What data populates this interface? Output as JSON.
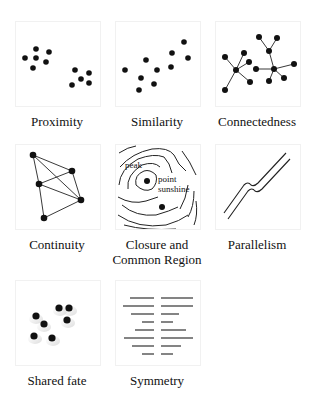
{
  "figure": {
    "panels": [
      {
        "id": "proximity",
        "caption": "Proximity"
      },
      {
        "id": "similarity",
        "caption": "Similarity"
      },
      {
        "id": "connectedness",
        "caption": "Connectedness"
      },
      {
        "id": "continuity",
        "caption": "Continuity"
      },
      {
        "id": "closure",
        "caption_line1": "Closure and",
        "caption_line2": "Common Region",
        "labels": {
          "peak": "peak",
          "point": "point",
          "sunshine": "sunshine"
        }
      },
      {
        "id": "parallelism",
        "caption": "Parallelism"
      },
      {
        "id": "shared-fate",
        "caption": "Shared fate"
      },
      {
        "id": "symmetry",
        "caption": "Symmetry"
      }
    ],
    "colors": {
      "ink": "#111111",
      "border": "#f1f1f1",
      "background": "#ffffff"
    }
  }
}
